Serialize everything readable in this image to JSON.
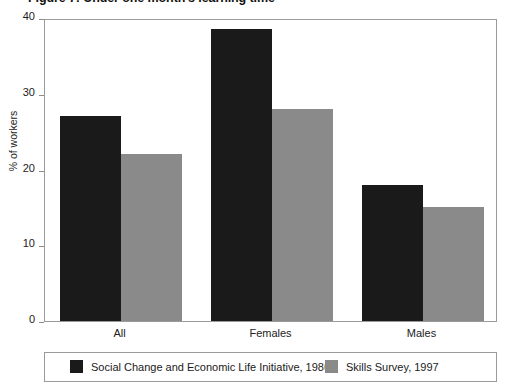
{
  "figure": {
    "title": "Figure 7: Under one month's learning time"
  },
  "chart_data": {
    "type": "bar",
    "title": "Figure 7: Under one month's learning time",
    "xlabel": "",
    "ylabel": "% of workers",
    "categories": [
      "All",
      "Females",
      "Males"
    ],
    "series": [
      {
        "name": "Social Change and Economic Life Initiative, 1986",
        "color": "#1a1a1a",
        "values": [
          27,
          38.5,
          18
        ]
      },
      {
        "name": "Skills Survey, 1997",
        "color": "#8a8a8a",
        "values": [
          22,
          28,
          15
        ]
      }
    ],
    "ylim": [
      0,
      40
    ],
    "yticks": [
      0,
      10,
      20,
      30,
      40
    ],
    "ytick_labels": [
      "0",
      "10",
      "20",
      "30",
      "40"
    ],
    "grid": false,
    "legend_position": "bottom"
  },
  "legend": {
    "entries": [
      {
        "label": "Social Change and Economic Life Initiative, 1986"
      },
      {
        "label": "Skills Survey, 1997"
      }
    ]
  }
}
